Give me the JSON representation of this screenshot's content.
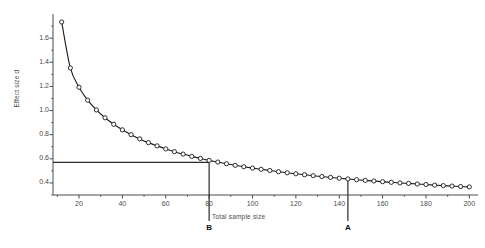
{
  "chart_data": {
    "type": "line",
    "title": "",
    "subtitle": "",
    "xlabel": "Total sample size",
    "ylabel": "Effect size d",
    "xlim": [
      8,
      204
    ],
    "ylim": [
      0.3,
      1.8
    ],
    "grid": false,
    "legend": null,
    "marker": "open-circle",
    "line_color": "#1a1a1a",
    "marker_fill": "#ffffff",
    "xticks": [
      20,
      40,
      60,
      80,
      100,
      120,
      140,
      160,
      180,
      200
    ],
    "xtick_labels": [
      "20",
      "40",
      "60",
      "80",
      "100",
      "120",
      "140",
      "160",
      "180",
      "200"
    ],
    "yticks": [
      0.4,
      0.6,
      0.8,
      1.0,
      1.2,
      1.4,
      1.6
    ],
    "ytick_labels": [
      "0.4",
      "0.6",
      "0.8",
      "1.0",
      "1.2",
      "1.4",
      "1.6"
    ],
    "x": [
      12,
      16,
      20,
      24,
      28,
      32,
      36,
      40,
      44,
      48,
      52,
      56,
      60,
      64,
      68,
      72,
      76,
      80,
      84,
      88,
      92,
      96,
      100,
      104,
      108,
      112,
      116,
      120,
      124,
      128,
      132,
      136,
      140,
      144,
      148,
      152,
      156,
      160,
      164,
      168,
      172,
      176,
      180,
      184,
      188,
      192,
      196,
      200
    ],
    "y": [
      1.734,
      1.353,
      1.193,
      1.086,
      1.005,
      0.94,
      0.886,
      0.84,
      0.8,
      0.765,
      0.734,
      0.707,
      0.682,
      0.659,
      0.639,
      0.62,
      0.603,
      0.587,
      0.573,
      0.559,
      0.546,
      0.534,
      0.523,
      0.513,
      0.503,
      0.493,
      0.484,
      0.476,
      0.468,
      0.46,
      0.453,
      0.446,
      0.439,
      0.433,
      0.427,
      0.421,
      0.416,
      0.41,
      0.405,
      0.4,
      0.396,
      0.391,
      0.387,
      0.382,
      0.378,
      0.374,
      0.37,
      0.367
    ],
    "annotations": [
      {
        "label": "A",
        "x": 144,
        "y": 0.433,
        "kind": "vertical-reference"
      },
      {
        "label": "B",
        "x": 80,
        "y": 0.57,
        "kind": "vertical-reference"
      }
    ],
    "reference_lines": [
      {
        "orientation": "horizontal",
        "value": 0.57,
        "from_x": 8,
        "to_x": 80
      },
      {
        "orientation": "vertical",
        "value": 80,
        "from_y": 0.3,
        "to_y": 0.57
      },
      {
        "orientation": "vertical",
        "value": 144,
        "from_y": 0.3,
        "to_y": 0.433
      }
    ]
  }
}
